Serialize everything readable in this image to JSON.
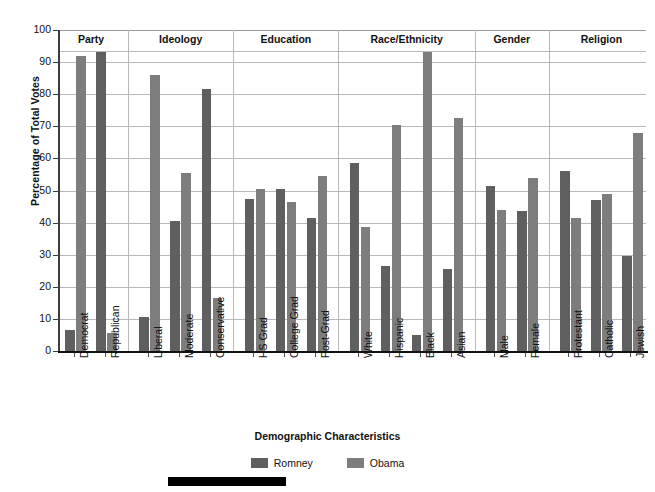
{
  "chart_data": {
    "type": "bar",
    "title": "",
    "xlabel": "Demographic Characteristics",
    "ylabel": "Percentage of Total Votes",
    "ylim": [
      0,
      100
    ],
    "ytick_values": [
      0,
      10,
      20,
      30,
      40,
      50,
      60,
      70,
      80,
      90,
      100
    ],
    "grid": true,
    "legend_position": "bottom-center",
    "categories": [
      "Democrat",
      "Republican",
      "Liberal",
      "Moderate",
      "Conservative",
      "HS Grad",
      "College Grad",
      "Post-Grad",
      "White",
      "Hispanic",
      "Black",
      "Asian",
      "Male",
      "Female",
      "Protestant",
      "Catholic",
      "Jewish"
    ],
    "series": [
      {
        "name": "Romney",
        "color": "#5f5f5f",
        "values": [
          6.5,
          93,
          10.5,
          40.5,
          81.5,
          47.5,
          50.5,
          41.5,
          58.5,
          26.5,
          5,
          25.5,
          51.5,
          43.5,
          56,
          47,
          29.5
        ]
      },
      {
        "name": "Obama",
        "color": "#7d7d7d",
        "values": [
          92,
          5.5,
          86,
          55.5,
          16.5,
          50.5,
          46.5,
          54.5,
          38.5,
          70.5,
          93,
          72.5,
          44,
          54,
          41.5,
          49,
          68
        ]
      }
    ],
    "groups": [
      {
        "label": "Party",
        "categories": [
          "Democrat",
          "Republican"
        ]
      },
      {
        "label": "Ideology",
        "categories": [
          "Liberal",
          "Moderate",
          "Conservative"
        ]
      },
      {
        "label": "Education",
        "categories": [
          "HS Grad",
          "College Grad",
          "Post-Grad"
        ]
      },
      {
        "label": "Race/Ethnicity",
        "categories": [
          "White",
          "Hispanic",
          "Black",
          "Asian"
        ]
      },
      {
        "label": "Gender",
        "categories": [
          "Male",
          "Female"
        ]
      },
      {
        "label": "Religion",
        "categories": [
          "Protestant",
          "Catholic",
          "Jewish"
        ]
      }
    ]
  }
}
